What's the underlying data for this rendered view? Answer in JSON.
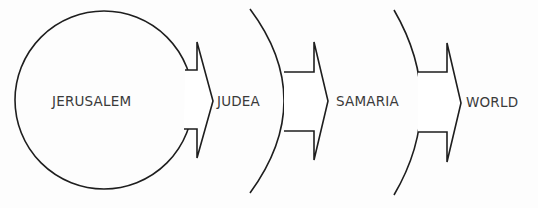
{
  "diagram": {
    "type": "concentric-expansion",
    "stroke_color": "#1e1e1e",
    "text_color": "#3a3a3a",
    "background": "#fdfdfd",
    "stages": [
      {
        "label": "JERUSALEM",
        "shape": "circle"
      },
      {
        "label": "JUDEA",
        "shape": "arc"
      },
      {
        "label": "SAMARIA",
        "shape": "arc"
      },
      {
        "label": "WORLD",
        "shape": "open"
      }
    ],
    "arrows": [
      {
        "from": "JERUSALEM",
        "to": "JUDEA"
      },
      {
        "from": "JUDEA",
        "to": "SAMARIA"
      },
      {
        "from": "SAMARIA",
        "to": "WORLD"
      }
    ]
  }
}
